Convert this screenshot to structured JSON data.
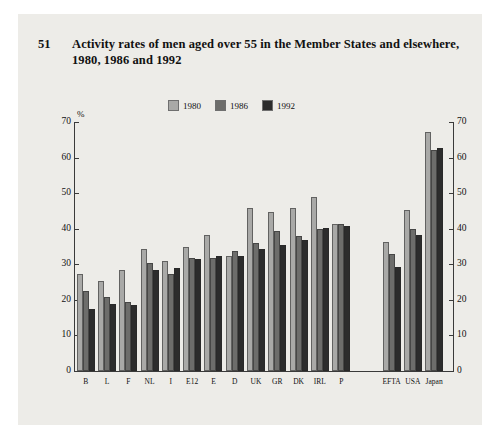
{
  "figure": {
    "number": "51",
    "title": "Activity rates of men aged over 55 in the Member States and elsewhere, 1980, 1986 and 1992"
  },
  "chart_data": {
    "type": "bar",
    "title": "Activity rates of men aged over 55 in the Member States and elsewhere, 1980, 1986 and 1992",
    "xlabel": "",
    "ylabel": "%",
    "ylim": [
      0,
      70
    ],
    "yticks": [
      0,
      10,
      20,
      30,
      40,
      50,
      60,
      70
    ],
    "ytick_labels": [
      "0",
      "10",
      "20",
      "30",
      "40",
      "50",
      "60",
      "70"
    ],
    "grid": false,
    "legend_position": "top-center",
    "dual_axis": true,
    "categories": [
      "B",
      "L",
      "F",
      "NL",
      "I",
      "E12",
      "E",
      "D",
      "UK",
      "GR",
      "DK",
      "IRL",
      "P",
      "EFTA",
      "USA",
      "Japan"
    ],
    "group_gap_after": "P",
    "series": [
      {
        "name": "1980",
        "color": "#a9a9a7",
        "values": [
          27.5,
          25.5,
          28.5,
          34.5,
          31.0,
          35.0,
          38.5,
          32.5,
          46.0,
          45.0,
          46.0,
          49.0,
          41.5,
          36.5,
          45.5,
          67.5
        ]
      },
      {
        "name": "1986",
        "color": "#6d6d6b",
        "values": [
          22.5,
          21.0,
          19.5,
          30.5,
          27.5,
          32.0,
          32.0,
          34.0,
          36.0,
          39.5,
          38.0,
          40.0,
          41.5,
          33.0,
          40.0,
          62.5
        ]
      },
      {
        "name": "1992",
        "color": "#2c2c2c",
        "values": [
          17.5,
          19.0,
          18.5,
          28.5,
          29.0,
          31.5,
          32.5,
          32.5,
          34.5,
          35.5,
          37.0,
          40.5,
          41.0,
          29.5,
          38.5,
          63.0
        ]
      }
    ]
  }
}
